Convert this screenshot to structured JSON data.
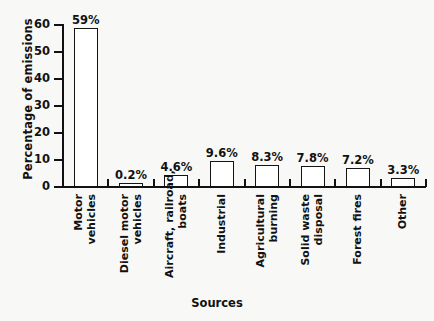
{
  "chart_data": {
    "type": "bar",
    "title": "",
    "xlabel": "Sources",
    "ylabel": "Percentage of emissions",
    "categories": [
      "Motor\nvehicles",
      "Diesel motor\nvehicles",
      "Aircraft, railroad,\nboats",
      "Industrial",
      "Agricultural\nburning",
      "Solid waste\ndisposal",
      "Forest fires",
      "Other"
    ],
    "values": [
      59,
      0.2,
      4.6,
      9.6,
      8.3,
      7.8,
      7.2,
      3.3
    ],
    "data_labels": [
      "59%",
      "0.2%",
      "4.6%",
      "9.6%",
      "8.3%",
      "7.8%",
      "7.2%",
      "3.3%"
    ],
    "ylim": [
      0,
      60
    ],
    "yticks": [
      0,
      10,
      20,
      30,
      40,
      50,
      60
    ],
    "ytick_labels": [
      "0",
      "10",
      "20",
      "30",
      "40",
      "50",
      "60"
    ],
    "grid": false,
    "legend": false,
    "bar_fill_color": "#ffffff",
    "bar_edge_color": "#141414",
    "background_color": "#f8f8f6",
    "text_color": "#111111"
  },
  "axes": {
    "y_title": "Percentage of emissions",
    "x_title": "Sources"
  }
}
